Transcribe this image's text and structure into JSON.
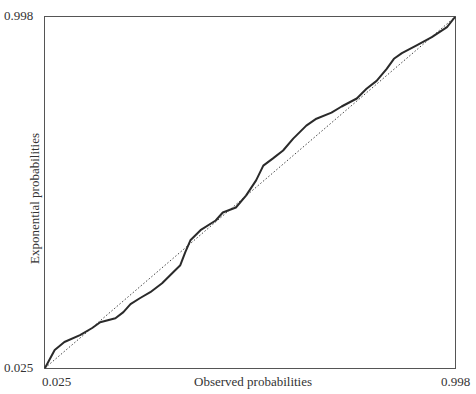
{
  "chart_data": {
    "type": "line",
    "title": "",
    "xlabel": "Observed probabilities",
    "ylabel": "Exponential probabilities",
    "xlim": [
      0.025,
      0.998
    ],
    "ylim": [
      0.025,
      0.998
    ],
    "x_ticks": [
      "0.025",
      "0.998"
    ],
    "y_ticks": [
      "0.025",
      "0.998"
    ],
    "grid": false,
    "legend": null,
    "series": [
      {
        "name": "P-P plot (empirical)",
        "style": "solid",
        "x": [
          0.025,
          0.048,
          0.071,
          0.108,
          0.137,
          0.156,
          0.192,
          0.211,
          0.228,
          0.251,
          0.275,
          0.303,
          0.334,
          0.346,
          0.358,
          0.37,
          0.394,
          0.43,
          0.447,
          0.478,
          0.502,
          0.526,
          0.543,
          0.566,
          0.59,
          0.614,
          0.645,
          0.669,
          0.705,
          0.729,
          0.765,
          0.788,
          0.812,
          0.836,
          0.853,
          0.872,
          0.908,
          0.943,
          0.979,
          0.998
        ],
        "y": [
          0.025,
          0.075,
          0.097,
          0.116,
          0.136,
          0.152,
          0.163,
          0.18,
          0.202,
          0.219,
          0.235,
          0.26,
          0.296,
          0.31,
          0.346,
          0.379,
          0.407,
          0.434,
          0.456,
          0.47,
          0.503,
          0.545,
          0.586,
          0.606,
          0.628,
          0.661,
          0.697,
          0.716,
          0.733,
          0.75,
          0.772,
          0.799,
          0.821,
          0.854,
          0.882,
          0.898,
          0.92,
          0.942,
          0.97,
          0.998
        ]
      },
      {
        "name": "Reference line y = x",
        "style": "dotted",
        "x": [
          0.025,
          0.998
        ],
        "y": [
          0.025,
          0.998
        ]
      }
    ]
  },
  "axes": {
    "x_min_label": "0.025",
    "x_max_label": "0.998",
    "y_min_label": "0.025",
    "y_max_label": "0.998",
    "x_title": "Observed probabilities",
    "y_title": "Exponential probabilities"
  }
}
